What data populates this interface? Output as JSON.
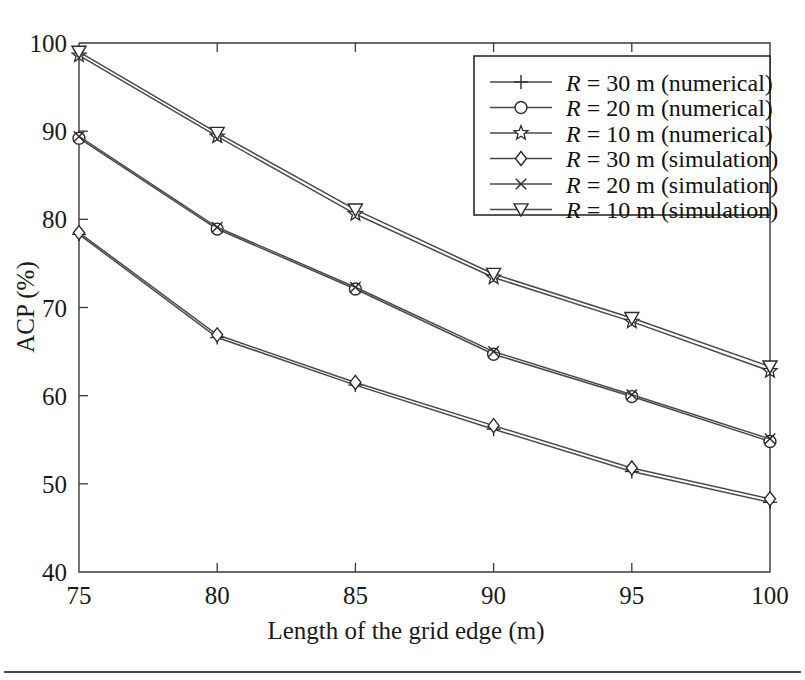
{
  "figure": {
    "title": "",
    "background_color": "#ffffff",
    "line_color": "#4a4a4a",
    "axis_color": "#3a3a3a"
  },
  "axes": {
    "x": {
      "label": "Length of the grid edge (m)",
      "ticks": [
        "75",
        "80",
        "85",
        "90",
        "95",
        "100"
      ],
      "min": 75,
      "max": 100
    },
    "y": {
      "label": "ACP (%)",
      "ticks": [
        "40",
        "50",
        "60",
        "70",
        "80",
        "90",
        "100"
      ],
      "min": 40,
      "max": 100
    }
  },
  "legend": {
    "position": "top-right",
    "entries": [
      {
        "marker": "plus-icon",
        "var": "R",
        "eq": " = 30 m (numerical)"
      },
      {
        "marker": "circle-icon",
        "var": "R",
        "eq": " = 20 m (numerical)"
      },
      {
        "marker": "star-icon",
        "var": "R",
        "eq": " = 10 m (numerical)"
      },
      {
        "marker": "diamond-icon",
        "var": "R",
        "eq": " = 30 m (simulation)"
      },
      {
        "marker": "cross-icon",
        "var": "R",
        "eq": " = 20 m (simulation)"
      },
      {
        "marker": "triangle-down-icon",
        "var": "R",
        "eq": " = 10 m (simulation)"
      }
    ]
  },
  "chart_data": {
    "type": "line",
    "title": "",
    "xlabel": "Length of the grid edge (m)",
    "ylabel": "ACP (%)",
    "xlim": [
      75,
      100
    ],
    "ylim": [
      40,
      100
    ],
    "xticks": [
      75,
      80,
      85,
      90,
      95,
      100
    ],
    "yticks": [
      40,
      50,
      60,
      70,
      80,
      90,
      100
    ],
    "grid": false,
    "legend_position": "upper right",
    "x": [
      75,
      80,
      85,
      90,
      95,
      100
    ],
    "series": [
      {
        "name": "R = 30 m (numerical)",
        "marker": "plus",
        "values": [
          78.3,
          66.6,
          61.2,
          56.2,
          51.4,
          47.9
        ]
      },
      {
        "name": "R = 20 m (numerical)",
        "marker": "circle",
        "values": [
          89.2,
          78.9,
          72.1,
          64.7,
          59.9,
          54.8
        ]
      },
      {
        "name": "R = 10 m (numerical)",
        "marker": "star",
        "values": [
          98.6,
          89.4,
          80.6,
          73.4,
          68.4,
          62.8
        ]
      },
      {
        "name": "R = 30 m (simulation)",
        "marker": "diamond",
        "values": [
          78.5,
          66.9,
          61.5,
          56.6,
          51.8,
          48.3
        ]
      },
      {
        "name": "R = 20 m (simulation)",
        "marker": "cross",
        "values": [
          89.4,
          79.1,
          72.3,
          65.0,
          60.1,
          55.1
        ]
      },
      {
        "name": "R = 10 m (simulation)",
        "marker": "triangle-down",
        "values": [
          99.0,
          89.8,
          81.1,
          73.8,
          68.8,
          63.3
        ]
      }
    ]
  }
}
